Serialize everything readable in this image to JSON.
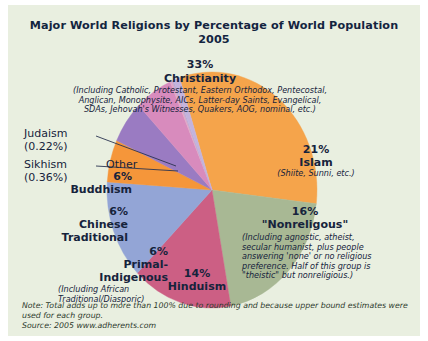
{
  "title": {
    "line1": "Major World Religions by Percentage of World Population",
    "line2": "2005"
  },
  "footnote": {
    "note": "Note: Total adds up to more than 100% due to rounding and because upper bound estimates were used for each group.",
    "source": "Source: 2005 www.adherents.com"
  },
  "labels": {
    "christianity": {
      "pct": "33%",
      "name": "Christianity",
      "detail": "(Including Catholic, Protestant, Eastern Orthodox, Pentecostal, Anglican, Monophysite, AICs, Latter-day Saints, Evangelical, SDAs, Jehovah's Witnesses, Quakers, AOG, nominal, etc.)"
    },
    "islam": {
      "pct": "21%",
      "name": "Islam",
      "detail": "(Shiite, Sunni, etc.)"
    },
    "nonreligious": {
      "pct": "16%",
      "name": "\"Nonreligous\"",
      "detail": "(Including agnostic, atheist, secular humanist, plus people answering 'none' or no religious preference. Half of this group is \"theistic\" but nonreligious.)"
    },
    "hinduism": {
      "pct": "14%",
      "name": "Hinduism"
    },
    "primal": {
      "pct": "6%",
      "name": "Primal-Indigenous",
      "detail": "(Including African Traditional/Diasporic)"
    },
    "chinese": {
      "pct": "6%",
      "name": "Chinese Traditional"
    },
    "buddhism": {
      "pct": "6%",
      "name": "Buddhism"
    },
    "other": {
      "name": "Other"
    },
    "judaism": {
      "name": "Judaism",
      "pct": "(0.22%)"
    },
    "sikhism": {
      "name": "Sikhism",
      "pct": "(0.36%)"
    }
  },
  "colors": {
    "background": "#e9efe0",
    "christianity": "#f5a44b",
    "islam": "#a8b894",
    "nonreligious": "#cc5f84",
    "hinduism": "#93a5d6",
    "primal": "#9a7bc2",
    "chinese": "#f5963a",
    "buddhism": "#d88bbd",
    "other": "#c3b3dd",
    "sikhism": "#e0a8c8",
    "judaism": "#b9a8d4",
    "text": "#16233c"
  },
  "chart_data": {
    "type": "pie",
    "title": "Major World Religions by Percentage of World Population 2005",
    "subtitle": "2005",
    "legend": "none",
    "labels": [
      "Christianity",
      "Islam",
      "\"Nonreligous\"",
      "Hinduism",
      "Chinese Traditional",
      "Primal-Indigenous",
      "Buddhism",
      "Sikhism",
      "Judaism",
      "Other"
    ],
    "values": [
      33,
      21,
      16,
      14,
      6,
      6,
      6,
      0.36,
      0.22,
      1.0
    ],
    "value_labels": [
      "33%",
      "21%",
      "16%",
      "14%",
      "6%",
      "6%",
      "6%",
      "0.36%",
      "0.22%",
      ""
    ],
    "colors": [
      "#f5a44b",
      "#a8b894",
      "#cc5f84",
      "#93a5d6",
      "#f5963a",
      "#9a7bc2",
      "#d88bbd",
      "#e0a8c8",
      "#b9a8d4",
      "#c3b3dd"
    ],
    "units": "percent of world population",
    "note": "Note: Total adds up to more than 100% due to rounding and because upper bound estimates were used for each group.",
    "source": "Source: 2005 www.adherents.com"
  }
}
